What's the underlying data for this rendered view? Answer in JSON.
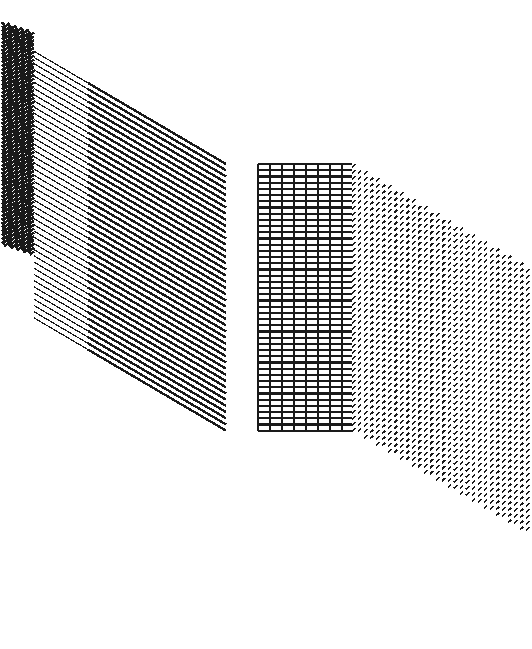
{
  "artwork": {
    "title": "Sheared Line Band with Graded Textures",
    "canvas": {
      "width": 532,
      "height": 649,
      "background": "#ffffff"
    },
    "ink_color": "#1a1a1a",
    "description": "Abstract op-art composition: a band of parallel horizontal rules that shears diagonally downward to the right, passing through five density zones - dense chevron zigzag, fine diagonal lines, heavy diagonal lines, sparse horizontals, square grid, and a final dense diagonal-dash hatch."
  },
  "geometry": {
    "line_count": 44,
    "line_pitch": 6.2,
    "band_top_left_y": 36,
    "band_bottom_left_y": 300,
    "shear_dx": 218,
    "shear_dy": 128,
    "horizontal_run_end_x": 352,
    "hatch_run_end_x": 528
  },
  "zones": [
    {
      "id": "zone-chevron",
      "name": "dense-chevron-zigzag",
      "label": "Dense chevron zigzag",
      "x_start": 8,
      "x_end": 34,
      "stroke_width": 2.6,
      "density": "very-high",
      "pattern": "zigzag"
    },
    {
      "id": "zone-fine-diagonal",
      "name": "fine-diagonal-lines",
      "label": "Fine diagonal lines",
      "x_start": 34,
      "x_end": 88,
      "stroke_width": 1.2,
      "density": "high",
      "pattern": "diagonal"
    },
    {
      "id": "zone-heavy-diagonal",
      "name": "heavy-diagonal-lines",
      "label": "Heavy diagonal lines",
      "x_start": 88,
      "x_end": 258,
      "stroke_width": 2.4,
      "density": "medium",
      "pattern": "diagonal"
    },
    {
      "id": "zone-sparse-horizontal",
      "name": "sparse-horizontal-rules",
      "label": "Sparse horizontal rules",
      "x_start": 204,
      "x_end": 258,
      "stroke_width": 1.4,
      "density": "low",
      "pattern": "horizontal"
    },
    {
      "id": "zone-grid",
      "name": "square-grid",
      "label": "Square grid",
      "x_start": 258,
      "x_end": 352,
      "stroke_width": 2.2,
      "cell_size": 12,
      "density": "medium",
      "pattern": "grid"
    },
    {
      "id": "zone-hatch",
      "name": "diagonal-dash-hatch",
      "label": "Diagonal dash hatch",
      "x_start": 352,
      "x_end": 528,
      "stroke_width": 1.6,
      "dash_pitch_x": 6,
      "dash_pitch_y": 6,
      "density": "very-high",
      "pattern": "dash-hatch"
    }
  ]
}
